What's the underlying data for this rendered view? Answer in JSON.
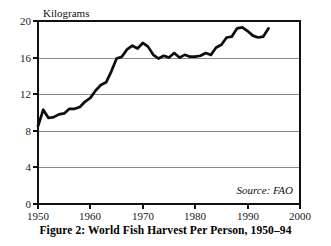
{
  "figure": {
    "caption": "Figure 2: World Fish Harvest Per Person, 1950–94",
    "source_note": "Source: FAO",
    "unit_label": "Kilograms"
  },
  "chart_data": {
    "type": "line",
    "title": "Figure 2: World Fish Harvest Per Person, 1950–94",
    "xlabel": "",
    "ylabel": "Kilograms",
    "xlim": [
      1950,
      2000
    ],
    "ylim": [
      0,
      20
    ],
    "grid": true,
    "legend": false,
    "annotations": [
      "Source: FAO"
    ],
    "xticks": [
      1950,
      1960,
      1970,
      1980,
      1990,
      2000
    ],
    "yticks": [
      0,
      4,
      8,
      12,
      16,
      20
    ],
    "series": [
      {
        "name": "World fish harvest per person",
        "units": "kilograms",
        "x": [
          1950,
          1951,
          1952,
          1953,
          1954,
          1955,
          1956,
          1957,
          1958,
          1959,
          1960,
          1961,
          1962,
          1963,
          1964,
          1965,
          1966,
          1967,
          1968,
          1969,
          1970,
          1971,
          1972,
          1973,
          1974,
          1975,
          1976,
          1977,
          1978,
          1979,
          1980,
          1981,
          1982,
          1983,
          1984,
          1985,
          1986,
          1987,
          1988,
          1989,
          1990,
          1991,
          1992,
          1993,
          1994
        ],
        "values": [
          8.5,
          10.3,
          9.4,
          9.5,
          9.8,
          9.9,
          10.4,
          10.4,
          10.6,
          11.2,
          11.6,
          12.4,
          13.0,
          13.3,
          14.5,
          15.9,
          16.1,
          16.9,
          17.3,
          17.0,
          17.6,
          17.2,
          16.3,
          15.9,
          16.2,
          16.0,
          16.5,
          16.0,
          16.3,
          16.1,
          16.1,
          16.2,
          16.5,
          16.3,
          17.1,
          17.4,
          18.2,
          18.3,
          19.2,
          19.3,
          18.9,
          18.4,
          18.2,
          18.3,
          19.2
        ]
      }
    ]
  }
}
